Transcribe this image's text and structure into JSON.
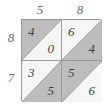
{
  "figure": {
    "kind": "lattice-multiplication-grid",
    "rows": 2,
    "columns": 2
  },
  "labels": {
    "top": [
      "5",
      "8"
    ],
    "left": [
      "8",
      "7"
    ]
  },
  "colors": {
    "shaded_triangle": "#bdbdbd",
    "plain_triangle": "#f6f6f6",
    "grid_line": "#9a9a9a",
    "digit_text": "#3f3f3f",
    "label_text": "#6d6d6d"
  },
  "cells": [
    {
      "position": "top-left",
      "upper": {
        "value": "4",
        "shaded": true
      },
      "lower": {
        "value": "0",
        "shaded": false
      }
    },
    {
      "position": "top-right",
      "upper": {
        "value": "6",
        "shaded": false
      },
      "lower": {
        "value": "4",
        "shaded": true
      }
    },
    {
      "position": "bottom-left",
      "upper": {
        "value": "3",
        "shaded": false
      },
      "lower": {
        "value": "5",
        "shaded": true
      }
    },
    {
      "position": "bottom-right",
      "upper": {
        "value": "5",
        "shaded": true
      },
      "lower": {
        "value": "6",
        "shaded": false
      }
    }
  ]
}
